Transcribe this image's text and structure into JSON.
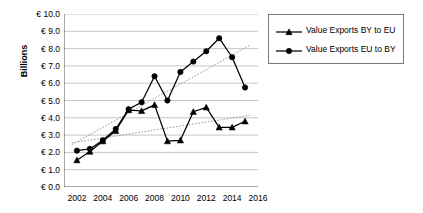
{
  "chart_data": {
    "type": "line",
    "title": "",
    "xlabel": "",
    "ylabel": "Billions",
    "xlim": [
      2001,
      2016
    ],
    "ylim": [
      0.0,
      10.0
    ],
    "grid": true,
    "legend_position": "right",
    "x": [
      2002,
      2003,
      2004,
      2005,
      2006,
      2007,
      2008,
      2009,
      2010,
      2011,
      2012,
      2013,
      2014,
      2015
    ],
    "xticks": [
      "2002",
      "2004",
      "2006",
      "2008",
      "2010",
      "2012",
      "2014",
      "2016"
    ],
    "xtick_values": [
      2002,
      2004,
      2006,
      2008,
      2010,
      2012,
      2014,
      2016
    ],
    "yticks": [
      "€ 0.0",
      "€ 1.0",
      "€ 2.0",
      "€ 3.0",
      "€ 4.0",
      "€ 5.0",
      "€ 6.0",
      "€ 7.0",
      "€ 8.0",
      "€ 9.0",
      "€ 10.0"
    ],
    "ytick_values": [
      0,
      1,
      2,
      3,
      4,
      5,
      6,
      7,
      8,
      9,
      10
    ],
    "series": [
      {
        "name": "Value Exports BY to EU",
        "marker": "triangle",
        "color": "#000000",
        "values": [
          1.55,
          2.05,
          2.65,
          3.25,
          4.45,
          4.4,
          4.75,
          2.65,
          2.7,
          4.35,
          4.6,
          3.45,
          3.45,
          3.8
        ]
      },
      {
        "name": "Value Exports EU to BY",
        "marker": "circle",
        "color": "#000000",
        "values": [
          2.1,
          2.2,
          2.7,
          3.35,
          4.5,
          4.9,
          6.4,
          5.0,
          6.65,
          7.25,
          7.85,
          8.6,
          7.5,
          5.75
        ]
      }
    ],
    "trendlines": [
      {
        "for": "Value Exports BY to EU",
        "style": "dotted",
        "color": "#9a9a9a",
        "x0": 2001.6,
        "y0": 2.55,
        "x1": 2015.4,
        "y1": 4.15
      },
      {
        "for": "Value Exports EU to BY",
        "style": "dotted",
        "color": "#9a9a9a",
        "x0": 2001.6,
        "y0": 2.45,
        "x1": 2015.4,
        "y1": 8.2
      }
    ]
  },
  "legend": {
    "items": [
      {
        "label": "Value Exports BY to EU",
        "marker": "triangle"
      },
      {
        "label": "Value Exports EU to BY",
        "marker": "circle"
      }
    ]
  }
}
